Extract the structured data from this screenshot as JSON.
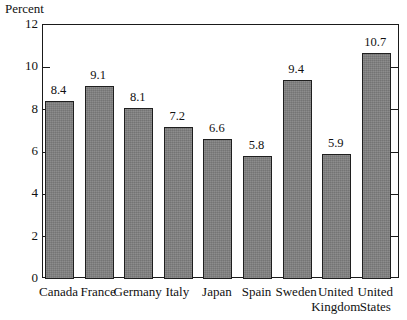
{
  "chart_data": {
    "type": "bar",
    "title": "",
    "subtitle": "",
    "xlabel": "",
    "ylabel": "Percent",
    "ylim": [
      0,
      12
    ],
    "yticks": [
      0,
      2,
      4,
      6,
      8,
      10,
      12
    ],
    "ytick_labels": [
      "0",
      "2",
      "4",
      "6",
      "8",
      "10",
      "12"
    ],
    "grid": false,
    "legend": null,
    "bar_labels_shown": true,
    "categories": [
      "Canada",
      "France",
      "Germany",
      "Italy",
      "Japan",
      "Spain",
      "Sweden",
      "United Kingdom",
      "United States"
    ],
    "category_label_lines": [
      [
        "Canada",
        ""
      ],
      [
        "France",
        ""
      ],
      [
        "Germany",
        ""
      ],
      [
        "Italy",
        ""
      ],
      [
        "Japan",
        ""
      ],
      [
        "Spain",
        ""
      ],
      [
        "Sweden",
        ""
      ],
      [
        "United",
        "Kingdom"
      ],
      [
        "United",
        "States"
      ]
    ],
    "values": [
      8.4,
      9.1,
      8.1,
      7.2,
      6.6,
      5.8,
      9.4,
      5.9,
      10.7
    ],
    "value_labels": [
      "8.4",
      "9.1",
      "8.1",
      "7.2",
      "6.6",
      "5.8",
      "9.4",
      "5.9",
      "10.7"
    ],
    "colors": {
      "bar_fill": "#808080",
      "bar_stroke": "#1f1f1f",
      "axis": "#1a1a1a",
      "text": "#111111",
      "background": "#ffffff"
    }
  }
}
